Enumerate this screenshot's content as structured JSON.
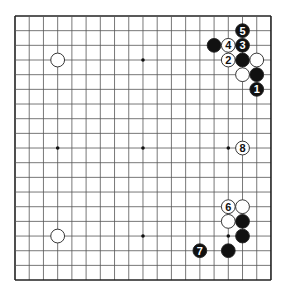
{
  "board": {
    "size": 19,
    "origin_x": 15,
    "origin_y": 16,
    "spacing_x": 14.22,
    "spacing_y": 14.67,
    "line_color": "#555555",
    "border_color": "#222222",
    "star_points": [
      [
        3,
        3
      ],
      [
        9,
        3
      ],
      [
        15,
        3
      ],
      [
        3,
        9
      ],
      [
        9,
        9
      ],
      [
        15,
        9
      ],
      [
        3,
        15
      ],
      [
        9,
        15
      ],
      [
        15,
        15
      ]
    ]
  },
  "stones": [
    {
      "color": "white",
      "col": 3,
      "row": 3,
      "label": ""
    },
    {
      "color": "white",
      "col": 3,
      "row": 15,
      "label": ""
    },
    {
      "color": "black",
      "col": 16,
      "row": 1,
      "label": "5"
    },
    {
      "color": "black",
      "col": 14,
      "row": 2,
      "label": ""
    },
    {
      "color": "white",
      "col": 15,
      "row": 2,
      "label": "4"
    },
    {
      "color": "black",
      "col": 16,
      "row": 2,
      "label": "3"
    },
    {
      "color": "white",
      "col": 15,
      "row": 3,
      "label": "2"
    },
    {
      "color": "black",
      "col": 16,
      "row": 3,
      "label": ""
    },
    {
      "color": "white",
      "col": 17,
      "row": 3,
      "label": ""
    },
    {
      "color": "white",
      "col": 16,
      "row": 4,
      "label": ""
    },
    {
      "color": "black",
      "col": 17,
      "row": 4,
      "label": ""
    },
    {
      "color": "black",
      "col": 17,
      "row": 5,
      "label": "1"
    },
    {
      "color": "white",
      "col": 16,
      "row": 9,
      "label": "8"
    },
    {
      "color": "white",
      "col": 15,
      "row": 13,
      "label": "6"
    },
    {
      "color": "white",
      "col": 16,
      "row": 13,
      "label": ""
    },
    {
      "color": "white",
      "col": 15,
      "row": 14,
      "label": ""
    },
    {
      "color": "black",
      "col": 16,
      "row": 14,
      "label": ""
    },
    {
      "color": "black",
      "col": 16,
      "row": 15,
      "label": ""
    },
    {
      "color": "black",
      "col": 15,
      "row": 16,
      "label": ""
    },
    {
      "color": "black",
      "col": 13,
      "row": 16,
      "label": "7"
    }
  ]
}
